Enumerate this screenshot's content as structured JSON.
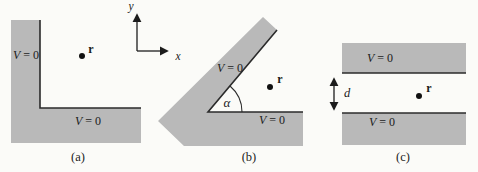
{
  "colors": {
    "conductor": "#b9b9b9",
    "edge": "#2b2b2b",
    "text": "#1c1c1c",
    "background": "#fbfbf8"
  },
  "axes": {
    "x_label": "x",
    "y_label": "y"
  },
  "panels": [
    {
      "caption": "(a)",
      "v_labels": [
        {
          "v": "V",
          "eq": "= 0"
        },
        {
          "v": "V",
          "eq": "= 0"
        }
      ],
      "point_label": "r"
    },
    {
      "caption": "(b)",
      "v_labels": [
        {
          "v": "V",
          "eq": "= 0"
        },
        {
          "v": "V",
          "eq": "= 0"
        }
      ],
      "point_label": "r",
      "angle_label": "α"
    },
    {
      "caption": "(c)",
      "v_labels": [
        {
          "v": "V",
          "eq": "= 0"
        },
        {
          "v": "V",
          "eq": "= 0"
        }
      ],
      "point_label": "r",
      "gap_label": "d"
    }
  ]
}
